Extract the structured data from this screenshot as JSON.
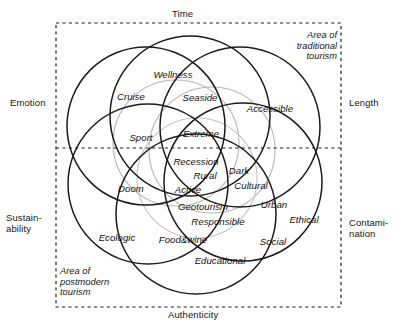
{
  "diagram": {
    "frame": {
      "style": "dashed",
      "color": "#222222",
      "x": 56,
      "y": 23,
      "width": 285,
      "height": 284,
      "divider_y": 148
    },
    "axis_labels": [
      {
        "name": "axis-label-time",
        "text": "Time",
        "x": 172,
        "y": 9,
        "align": "center"
      },
      {
        "name": "axis-label-length",
        "text": "Length",
        "x": 349,
        "y": 98,
        "align": "left"
      },
      {
        "name": "axis-label-contamination",
        "text": "Contami-\nnation",
        "x": 349,
        "y": 218,
        "align": "left"
      },
      {
        "name": "axis-label-authenticity",
        "text": "Authenticity",
        "x": 168,
        "y": 310,
        "align": "center"
      },
      {
        "name": "axis-label-sustainability",
        "text": "Sustain-\nability",
        "x": 6,
        "y": 213,
        "align": "left"
      },
      {
        "name": "axis-label-emotion",
        "text": "Emotion",
        "x": 10,
        "y": 98,
        "align": "left"
      }
    ],
    "area_notes": [
      {
        "name": "area-note-traditional",
        "text": "Area of\ntraditional\ntourism",
        "x": 281,
        "y": 30,
        "width": 56,
        "align": "right"
      },
      {
        "name": "area-note-postmodern",
        "text": "Area of\npostmodern\ntourism",
        "x": 60,
        "y": 266,
        "width": 70,
        "align": "left"
      }
    ],
    "circles": [
      {
        "name": "circle-upper-left",
        "cx": 146,
        "cy": 126,
        "r": 79,
        "stroke": "#1b1b1b",
        "width": 1.5
      },
      {
        "name": "circle-top",
        "cx": 190,
        "cy": 116,
        "r": 80,
        "stroke": "#1b1b1b",
        "width": 1.5
      },
      {
        "name": "circle-upper-right",
        "cx": 240,
        "cy": 127,
        "r": 80,
        "stroke": "#1b1b1b",
        "width": 1.5
      },
      {
        "name": "circle-lower-right",
        "cx": 243,
        "cy": 182,
        "r": 79,
        "stroke": "#1b1b1b",
        "width": 1.5
      },
      {
        "name": "circle-bottom",
        "cx": 196,
        "cy": 214,
        "r": 80,
        "stroke": "#1b1b1b",
        "width": 1.5
      },
      {
        "name": "circle-lower-left",
        "cx": 148,
        "cy": 184,
        "r": 80,
        "stroke": "#1b1b1b",
        "width": 1.5
      },
      {
        "name": "circle-faint-a",
        "cx": 176,
        "cy": 143,
        "r": 63,
        "stroke": "#b6b6b6",
        "width": 1.1
      },
      {
        "name": "circle-faint-b",
        "cx": 212,
        "cy": 150,
        "r": 63,
        "stroke": "#b6b6b6",
        "width": 1.1
      },
      {
        "name": "circle-faint-c",
        "cx": 197,
        "cy": 178,
        "r": 60,
        "stroke": "#c2c2c2",
        "width": 1.1
      }
    ],
    "terms": [
      {
        "name": "term-wellness",
        "text": "Wellness",
        "x": 173,
        "y": 74
      },
      {
        "name": "term-cruise",
        "text": "Cruise",
        "x": 131,
        "y": 96
      },
      {
        "name": "term-seaside",
        "text": "Seaside",
        "x": 200,
        "y": 97
      },
      {
        "name": "term-accessible",
        "text": "Accessible",
        "x": 270,
        "y": 108
      },
      {
        "name": "term-sport",
        "text": "Sport",
        "x": 141,
        "y": 137
      },
      {
        "name": "term-extreme",
        "text": "Extreme",
        "x": 201,
        "y": 133
      },
      {
        "name": "term-recession",
        "text": "Recession",
        "x": 196,
        "y": 161
      },
      {
        "name": "term-dark",
        "text": "Dark",
        "x": 239,
        "y": 170
      },
      {
        "name": "term-rural",
        "text": "Rural",
        "x": 205,
        "y": 175
      },
      {
        "name": "term-cultural",
        "text": "Cultural",
        "x": 251,
        "y": 185
      },
      {
        "name": "term-doom",
        "text": "Doom",
        "x": 131,
        "y": 188
      },
      {
        "name": "term-active",
        "text": "Active",
        "x": 188,
        "y": 189
      },
      {
        "name": "term-geotourism",
        "text": "Geotourism",
        "x": 203,
        "y": 206
      },
      {
        "name": "term-urban",
        "text": "Urban",
        "x": 274,
        "y": 204
      },
      {
        "name": "term-ethical",
        "text": "Ethical",
        "x": 304,
        "y": 219
      },
      {
        "name": "term-responsible",
        "text": "Responsible",
        "x": 218,
        "y": 221
      },
      {
        "name": "term-ecologic",
        "text": "Ecologic",
        "x": 117,
        "y": 237
      },
      {
        "name": "term-foodandwine",
        "text": "Food&wine",
        "x": 183,
        "y": 239
      },
      {
        "name": "term-social",
        "text": "Social",
        "x": 273,
        "y": 241
      },
      {
        "name": "term-educational",
        "text": "Educational",
        "x": 220,
        "y": 260
      }
    ]
  }
}
